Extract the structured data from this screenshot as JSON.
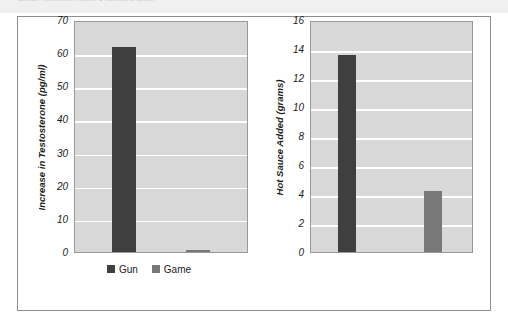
{
  "caption": {
    "text": "Source: Klinesmith, Kasser, & McAndrew (2006)"
  },
  "legend": {
    "position": "bottom-left",
    "items": [
      {
        "label": "Gun",
        "color": "#3f3f3f",
        "swatch": "legend-swatch-gun"
      },
      {
        "label": "Game",
        "color": "#787878",
        "swatch": "legend-swatch-game"
      }
    ]
  },
  "chart_data": [
    {
      "id": "testosterone",
      "type": "bar",
      "title": "",
      "xlabel": "",
      "ylabel": "Increase in Testosterone (pg/ml)",
      "categories": [
        "Gun",
        "Game"
      ],
      "series": [
        {
          "name": "Gun",
          "values": [
            62.0
          ],
          "color": "#3f3f3f"
        },
        {
          "name": "Game",
          "values": [
            0.5
          ],
          "color": "#787878"
        }
      ],
      "values": [
        62.0,
        0.5
      ],
      "ylim": [
        0,
        70
      ],
      "yticks": [
        70,
        60,
        50,
        40,
        30,
        20,
        10,
        0
      ],
      "grid": true,
      "plot_background": "#d8d8d8",
      "gridline_color": "#ffffff"
    },
    {
      "id": "hot-sauce",
      "type": "bar",
      "title": "",
      "xlabel": "",
      "ylabel": "Hot Sauce Added (grams)",
      "categories": [
        "Gun",
        "Game"
      ],
      "series": [
        {
          "name": "Gun",
          "values": [
            13.6
          ],
          "color": "#3f3f3f"
        },
        {
          "name": "Game",
          "values": [
            4.2
          ],
          "color": "#787878"
        }
      ],
      "values": [
        13.6,
        4.2
      ],
      "ylim": [
        0,
        16
      ],
      "yticks": [
        16,
        14,
        12,
        10,
        8,
        6,
        4,
        2,
        0
      ],
      "grid": true,
      "plot_background": "#d8d8d8",
      "gridline_color": "#ffffff"
    }
  ]
}
